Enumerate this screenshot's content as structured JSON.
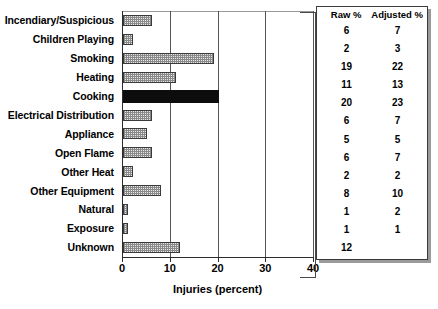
{
  "chart_data": {
    "type": "bar",
    "orientation": "horizontal",
    "title": "",
    "xlabel": "Injuries (percent)",
    "ylabel": "",
    "xlim": [
      0,
      40
    ],
    "xticks": [
      0,
      10,
      20,
      30,
      40
    ],
    "grid": true,
    "gridlines_at": [
      10,
      20,
      30,
      40
    ],
    "legend": "none",
    "categories": [
      "Incendiary/Suspicious",
      "Children Playing",
      "Smoking",
      "Heating",
      "Cooking",
      "Electrical Distribution",
      "Appliance",
      "Open Flame",
      "Other Heat",
      "Other Equipment",
      "Natural",
      "Exposure",
      "Unknown"
    ],
    "values": [
      6,
      2,
      19,
      11,
      20,
      6,
      5,
      6,
      2,
      8,
      1,
      1,
      12
    ],
    "highlight_category": "Cooking",
    "highlight_color": "#0d0d0d",
    "bar_color": "#e8e8e8",
    "bar_edge_color": "#3a3a3a"
  },
  "side_table": {
    "columns": [
      "Raw %",
      "Adjusted %"
    ],
    "rows": [
      {
        "raw": "6",
        "adjusted": "7"
      },
      {
        "raw": "2",
        "adjusted": "3"
      },
      {
        "raw": "19",
        "adjusted": "22"
      },
      {
        "raw": "11",
        "adjusted": "13"
      },
      {
        "raw": "20",
        "adjusted": "23"
      },
      {
        "raw": "6",
        "adjusted": "7"
      },
      {
        "raw": "5",
        "adjusted": "5"
      },
      {
        "raw": "6",
        "adjusted": "7"
      },
      {
        "raw": "2",
        "adjusted": "2"
      },
      {
        "raw": "8",
        "adjusted": "10"
      },
      {
        "raw": "1",
        "adjusted": "2"
      },
      {
        "raw": "1",
        "adjusted": "1"
      },
      {
        "raw": "12",
        "adjusted": ""
      }
    ]
  }
}
